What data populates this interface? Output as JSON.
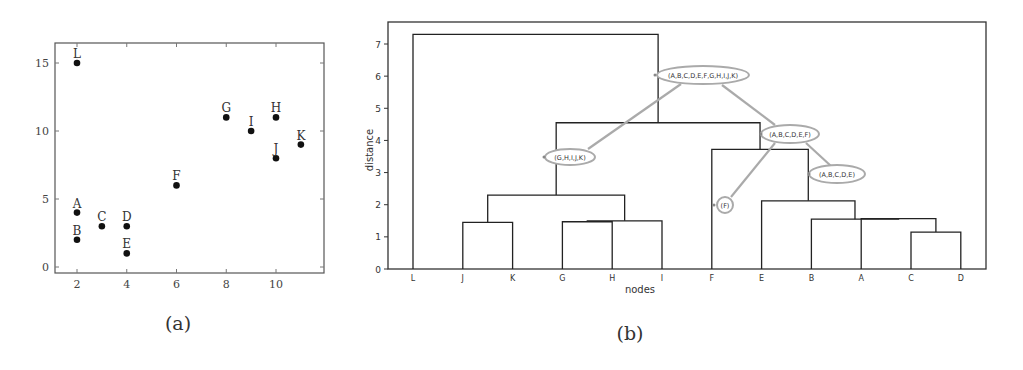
{
  "captions": {
    "a": "(a)",
    "b": "(b)"
  },
  "chart_data": [
    {
      "id": "a",
      "type": "scatter",
      "title": "",
      "xlabel": "",
      "ylabel": "",
      "xlim": [
        1.1,
        11.9
      ],
      "ylim": [
        -0.45,
        16.5
      ],
      "xticks": [
        2,
        4,
        6,
        8,
        10
      ],
      "yticks": [
        0,
        5,
        10,
        15
      ],
      "grid": false,
      "points": [
        {
          "label": "A",
          "x": 2,
          "y": 4
        },
        {
          "label": "B",
          "x": 2,
          "y": 2
        },
        {
          "label": "C",
          "x": 3,
          "y": 3
        },
        {
          "label": "D",
          "x": 4,
          "y": 3
        },
        {
          "label": "E",
          "x": 4,
          "y": 1
        },
        {
          "label": "F",
          "x": 6,
          "y": 6
        },
        {
          "label": "G",
          "x": 8,
          "y": 11
        },
        {
          "label": "H",
          "x": 10,
          "y": 11
        },
        {
          "label": "I",
          "x": 9,
          "y": 10
        },
        {
          "label": "J",
          "x": 10,
          "y": 8
        },
        {
          "label": "K",
          "x": 11,
          "y": 9
        },
        {
          "label": "L",
          "x": 2,
          "y": 15
        }
      ]
    },
    {
      "id": "b",
      "type": "dendrogram",
      "title": "",
      "xlabel": "nodes",
      "ylabel": "distance",
      "ylim": [
        0,
        7.6
      ],
      "yticks": [
        0,
        1,
        2,
        3,
        4,
        5,
        6,
        7
      ],
      "leaf_order": [
        "L",
        "J",
        "K",
        "G",
        "H",
        "I",
        "F",
        "E",
        "B",
        "A",
        "C",
        "D"
      ],
      "merges": [
        {
          "left": "J",
          "right": "K",
          "height": 1.45
        },
        {
          "left": "G",
          "right": "H",
          "height": 1.47
        },
        {
          "left": "(G,H)",
          "right": "I",
          "height": 1.5
        },
        {
          "left": "C",
          "right": "D",
          "height": 1.15
        },
        {
          "left": "A",
          "right": "(C,D)",
          "height": 1.57
        },
        {
          "left": "B",
          "right": "(A,C,D)",
          "height": 1.55
        },
        {
          "left": "E",
          "right": "(A,B,C,D)",
          "height": 2.12
        },
        {
          "left": "(J,K)",
          "right": "(G,H,I)",
          "height": 2.3
        },
        {
          "left": "F",
          "right": "(A,B,C,D,E)",
          "height": 3.72
        },
        {
          "left": "(G,H,I,J,K)",
          "right": "(A,B,C,D,E,F)",
          "height": 4.55
        },
        {
          "left": "L",
          "right": "(A,B,C,D,E,F,G,H,I,J,K)",
          "height": 7.3
        }
      ],
      "annotations": [
        {
          "text": "(A,B,C,D,E,F,G,H,I,J,K)",
          "anchor_height": 6.0
        },
        {
          "text": "(G,H,I,J,K)",
          "anchor_height": 3.5
        },
        {
          "text": "(A,B,C,D,E,F)",
          "anchor_height": 4.35
        },
        {
          "text": "(A,B,C,D,E)",
          "anchor_height": 3.0
        },
        {
          "text": "(F)",
          "anchor_height": 2.0
        }
      ]
    }
  ]
}
